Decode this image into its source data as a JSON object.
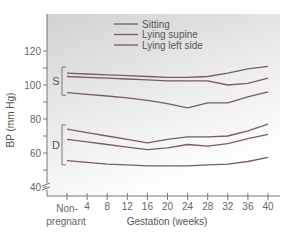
{
  "chart_data": {
    "type": "line",
    "title": "",
    "xlabel": "Gestation (weeks)",
    "ylabel": "BP (mm Hg)",
    "ylim": [
      40,
      125
    ],
    "yticks": [
      40,
      60,
      80,
      100,
      120
    ],
    "x_categories": [
      "Non-pregnant",
      "4",
      "8",
      "12",
      "16",
      "20",
      "24",
      "28",
      "32",
      "36",
      "40"
    ],
    "x_tick_labels": {
      "nonpregnant_line1": "Non-",
      "nonpregnant_line2": "pregnant"
    },
    "legend": [
      "Sitting",
      "Lying supine",
      "Lying left side"
    ],
    "legend_position": "top-center",
    "grid": false,
    "groups": {
      "systolic": "S",
      "diastolic": "D"
    },
    "series": [
      {
        "name": "Systolic - top",
        "group": "S",
        "values": [
          107,
          106.5,
          106,
          105.5,
          105,
          104.5,
          104.5,
          105,
          107,
          109.5,
          111
        ]
      },
      {
        "name": "Systolic - middle",
        "group": "S",
        "values": [
          105,
          104.5,
          104,
          103.5,
          103,
          102.5,
          102.5,
          102.5,
          100,
          101,
          104
        ]
      },
      {
        "name": "Systolic - bottom",
        "group": "S",
        "values": [
          95.5,
          94.5,
          93.5,
          92.5,
          91,
          89,
          86.5,
          89.5,
          89.5,
          93,
          96
        ]
      },
      {
        "name": "Diastolic - top",
        "group": "D",
        "values": [
          74,
          72,
          70,
          68,
          66,
          68,
          69.5,
          69.5,
          70,
          73,
          77
        ]
      },
      {
        "name": "Diastolic - middle",
        "group": "D",
        "values": [
          68,
          66.5,
          65,
          63.5,
          62,
          63,
          65,
          64,
          65.5,
          68.5,
          71
        ]
      },
      {
        "name": "Diastolic - bottom",
        "group": "D",
        "values": [
          55.5,
          54.5,
          53.5,
          53,
          52.5,
          52.5,
          52.5,
          53,
          53.5,
          55,
          57.5
        ]
      }
    ]
  }
}
